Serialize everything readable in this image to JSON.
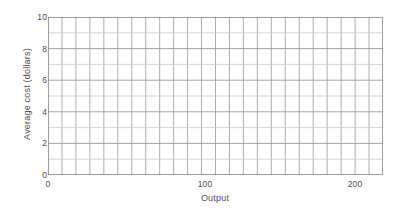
{
  "chart_data": {
    "type": "line",
    "title": "",
    "subtitle": "",
    "xlabel": "Output",
    "ylabel": "Average cost (dollars)",
    "xlim": [
      0,
      224
    ],
    "ylim": [
      0,
      10
    ],
    "x_ticks": [
      {
        "value": 0,
        "label": "0"
      },
      {
        "value": 100,
        "label": "100"
      },
      {
        "value": 200,
        "label": "200"
      }
    ],
    "y_ticks": [
      {
        "value": 0,
        "label": "0"
      },
      {
        "value": 2,
        "label": "2"
      },
      {
        "value": 4,
        "label": "4"
      },
      {
        "value": 6,
        "label": "6"
      },
      {
        "value": 8,
        "label": "8"
      },
      {
        "value": 10,
        "label": "10"
      }
    ],
    "grid": true,
    "grid_columns": 24,
    "grid_rows": 10,
    "grid_color": "#9a9a9a",
    "grid_minor_color": "#c9c9c9",
    "legend": null,
    "legend_position": "none",
    "series": [],
    "annotations": [],
    "note": "Blank graph-paper axes: no data series are plotted."
  },
  "axes": {
    "y_title": "Average cost (dollars)",
    "x_title": "Output",
    "y_tick_labels": [
      "10",
      "8",
      "6",
      "4",
      "2",
      "0"
    ],
    "x_tick_labels": [
      "0",
      "100",
      "200"
    ]
  },
  "colors": {
    "background": "#ffffff",
    "grid": "#9a9a9a",
    "grid_light": "#c9c9c9",
    "text": "#4f4f4f"
  }
}
